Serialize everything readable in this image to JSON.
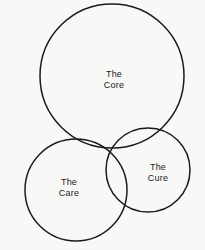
{
  "diagram": {
    "type": "venn-diagram",
    "background_color": "#f8f8f7",
    "stroke_color": "#1a1a1a",
    "text_color": "#1b1b1b",
    "circles": [
      {
        "id": "core",
        "label_line1": "The",
        "label_line2": "Core",
        "cx": 112,
        "cy": 76,
        "r": 72,
        "label_x": 114,
        "label_y": 80
      },
      {
        "id": "care",
        "label_line1": "The",
        "label_line2": "Care",
        "cx": 76,
        "cy": 190,
        "r": 51,
        "label_x": 69,
        "label_y": 188
      },
      {
        "id": "cure",
        "label_line1": "The",
        "label_line2": "Cure",
        "cx": 148,
        "cy": 170,
        "r": 42,
        "label_x": 158,
        "label_y": 173
      }
    ]
  }
}
